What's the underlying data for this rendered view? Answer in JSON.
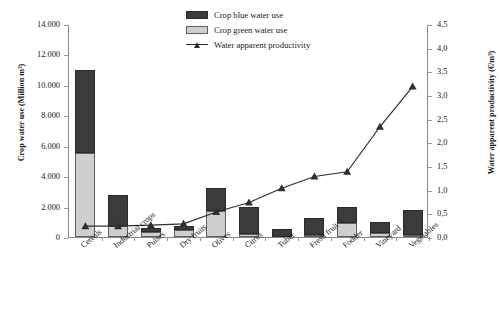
{
  "chart_data": {
    "type": "bar",
    "title": "",
    "categories": [
      "Cereals",
      "Industrial crops",
      "Pulses",
      "Dry fruits",
      "Olives",
      "Citrus",
      "Tuber",
      "Fresh fruit",
      "Fodder",
      "Vineyard",
      "Vegetables"
    ],
    "series": [
      {
        "name": "Crop green water use",
        "axis": "left",
        "values": [
          5500,
          700,
          350,
          450,
          1700,
          200,
          0,
          120,
          900,
          260,
          150
        ]
      },
      {
        "name": "Crop blue water use",
        "axis": "left",
        "values": [
          5500,
          2050,
          250,
          250,
          1500,
          1750,
          500,
          1130,
          1050,
          740,
          1650
        ]
      },
      {
        "name": "Water apparent productivity",
        "axis": "right",
        "values": [
          0.25,
          0.25,
          0.27,
          0.3,
          0.55,
          0.75,
          1.05,
          1.3,
          1.4,
          2.35,
          3.2
        ]
      }
    ],
    "totals": [
      11000,
      2750,
      600,
      700,
      3200,
      1950,
      500,
      1250,
      1950,
      1000,
      1800
    ],
    "xlabel": "",
    "ylabel_left": "Crop water use (Million m³)",
    "ylabel_right": "Water apparent productivity (€/m³)",
    "ylim_left": [
      0,
      14000
    ],
    "ylim_right": [
      0.0,
      4.5
    ],
    "yticks_left": [
      "0",
      "2.000",
      "4.000",
      "6.000",
      "8.000",
      "10.000",
      "12.000",
      "14.000"
    ],
    "yticks_left_values": [
      0,
      2000,
      4000,
      6000,
      8000,
      10000,
      12000,
      14000
    ],
    "yticks_right": [
      "0,0",
      "0,5",
      "1,0",
      "1,5",
      "2,0",
      "2,5",
      "3,0",
      "3,5",
      "4,0",
      "4,5"
    ],
    "yticks_right_values": [
      0,
      0.5,
      1.0,
      1.5,
      2.0,
      2.5,
      3.0,
      3.5,
      4.0,
      4.5
    ],
    "grid": false,
    "legend_position": "top-center",
    "colors": {
      "blue_water": "#3b3b3b",
      "green_water": "#cfcfcf",
      "line": "#2f2f2f",
      "axis": "#8a8a8a"
    }
  },
  "legend": {
    "items": [
      {
        "label": "Crop blue water use",
        "marker": "square-dark"
      },
      {
        "label": "Crop green water use",
        "marker": "square-light"
      },
      {
        "label": "Water apparent productivity",
        "marker": "line-triangle"
      }
    ]
  }
}
